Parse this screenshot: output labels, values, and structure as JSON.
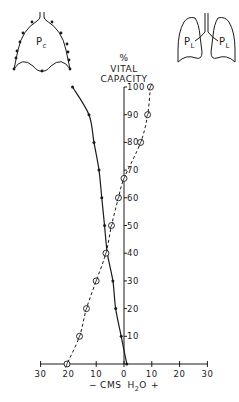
{
  "chart_data": {
    "type": "line",
    "title": "",
    "ylabel": "% VITAL CAPACITY",
    "xlabel": "− CMS H2O +",
    "xlabel_parts": {
      "minus": "−",
      "units": "CMS",
      "h": "H",
      "sub": "2",
      "o": "O",
      "plus": "+"
    },
    "ylabel_parts": {
      "pct": "%",
      "line1": "VITAL",
      "line2": "CAPACITY"
    },
    "xlim": [
      -30,
      30
    ],
    "ylim": [
      0,
      100
    ],
    "x_ticks": [
      -30,
      -20,
      -10,
      0,
      10,
      20,
      30
    ],
    "x_tick_labels": [
      "30",
      "20",
      "10",
      "0",
      "10",
      "20",
      "30"
    ],
    "y_ticks": [
      10,
      20,
      30,
      40,
      50,
      60,
      70,
      80,
      90,
      100
    ],
    "y_tick_labels": [
      "10",
      "20",
      "30",
      "40",
      "50",
      "60",
      "70",
      "80",
      "90",
      "100"
    ],
    "grid": false,
    "series": [
      {
        "name": "Pc (chest wall)",
        "style": "solid",
        "marker": "dot",
        "points": [
          {
            "x": -18.5,
            "y": 100
          },
          {
            "x": -12.6,
            "y": 90
          },
          {
            "x": -10.8,
            "y": 80
          },
          {
            "x": -9,
            "y": 70
          },
          {
            "x": -8,
            "y": 60
          },
          {
            "x": -7,
            "y": 50
          },
          {
            "x": -6,
            "y": 40
          },
          {
            "x": -4,
            "y": 30
          },
          {
            "x": -3,
            "y": 20
          },
          {
            "x": -1,
            "y": 10
          },
          {
            "x": 1,
            "y": 0
          }
        ]
      },
      {
        "name": "PL (lung)",
        "style": "dashed",
        "marker": "open-circle",
        "points": [
          {
            "x": 9.5,
            "y": 100
          },
          {
            "x": 8.5,
            "y": 90
          },
          {
            "x": 6,
            "y": 80
          },
          {
            "x": 0,
            "y": 67
          },
          {
            "x": -2,
            "y": 60
          },
          {
            "x": -4.5,
            "y": 50
          },
          {
            "x": -6.5,
            "y": 40
          },
          {
            "x": -10,
            "y": 30
          },
          {
            "x": -13.5,
            "y": 20
          },
          {
            "x": -16,
            "y": 10
          },
          {
            "x": -20.5,
            "y": 0
          }
        ]
      }
    ],
    "annotations": [
      {
        "text": "Pc",
        "sub": "c",
        "base": "P",
        "position": "top-left chest wall diagram"
      },
      {
        "text": "PL",
        "sub": "L",
        "base": "P",
        "position": "top-right lung diagram (two labels)"
      }
    ]
  },
  "diagrams": {
    "chest_label": {
      "base": "P",
      "sub": "c"
    },
    "lung_label_left": {
      "base": "P",
      "sub": "L"
    },
    "lung_label_right": {
      "base": "P",
      "sub": "L"
    }
  },
  "colors": {
    "ink": "#1a1a1a",
    "background": "#ffffff"
  }
}
